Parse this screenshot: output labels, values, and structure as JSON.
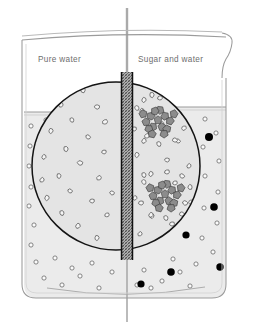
{
  "figure": {
    "type": "scientific-illustration",
    "width": 254,
    "height": 330,
    "background_color": "#ffffff"
  },
  "labels": {
    "left_label": "Pure water",
    "right_label": "Sugar and water"
  },
  "colors": {
    "outline": "#8f8f8f",
    "liquid_fill": "#ebebeb",
    "magnifier_fill": "#e2e2e2",
    "magnifier_stroke": "#1a1a1a",
    "membrane_fill": "#9a9a9a",
    "membrane_stroke": "#111111",
    "rod": "#a8a8a8",
    "sugar_solid": "#000000",
    "water_circle_stroke": "#6a6a6a",
    "crystal_fill": "#8c8c8c",
    "crystal_stroke": "#3a3a3a",
    "molecule_fill": "#f5f5f5",
    "molecule_stroke": "#555555",
    "label_text": "#6e6e6e"
  },
  "beaker": {
    "left_x": 22,
    "right_x": 228,
    "top_y": 31,
    "bottom_y": 311,
    "rim_y": 36,
    "base_ellipse_y": 296,
    "spout_side": "right",
    "corner_radius": 14
  },
  "liquid": {
    "left_surface_y": 112,
    "right_surface_y": 107,
    "fill_color": "#ebebeb",
    "note": "right compartment level is higher than left"
  },
  "membrane": {
    "label": "semipermeable-membrane",
    "x_center": 127,
    "width": 11,
    "top_y": 72,
    "bottom_y": 260,
    "pattern": "cross-hatch",
    "thin_line_top_y": 8,
    "thin_line_bottom_y": 320
  },
  "magnifier": {
    "label": "magnified-view-circle",
    "center_x": 116,
    "center_y": 166,
    "radius": 84
  },
  "magnified_left_molecules": [
    {
      "x": 83,
      "y": 90,
      "r": 3.0,
      "rot": 20
    },
    {
      "x": 61,
      "y": 105,
      "r": 2.6,
      "rot": 70
    },
    {
      "x": 97,
      "y": 107,
      "r": 2.8,
      "rot": 130
    },
    {
      "x": 72,
      "y": 120,
      "r": 2.5,
      "rot": 10
    },
    {
      "x": 105,
      "y": 122,
      "r": 2.9,
      "rot": 95
    },
    {
      "x": 51,
      "y": 131,
      "r": 2.7,
      "rot": 45
    },
    {
      "x": 88,
      "y": 137,
      "r": 2.6,
      "rot": 160
    },
    {
      "x": 66,
      "y": 149,
      "r": 2.8,
      "rot": 25
    },
    {
      "x": 104,
      "y": 152,
      "r": 2.5,
      "rot": 115
    },
    {
      "x": 44,
      "y": 157,
      "r": 2.6,
      "rot": 60
    },
    {
      "x": 80,
      "y": 163,
      "r": 2.9,
      "rot": 140
    },
    {
      "x": 59,
      "y": 176,
      "r": 2.6,
      "rot": 30
    },
    {
      "x": 99,
      "y": 178,
      "r": 2.7,
      "rot": 85
    },
    {
      "x": 70,
      "y": 191,
      "r": 2.5,
      "rot": 155
    },
    {
      "x": 47,
      "y": 198,
      "r": 2.8,
      "rot": 50
    },
    {
      "x": 92,
      "y": 201,
      "r": 2.6,
      "rot": 120
    },
    {
      "x": 62,
      "y": 213,
      "r": 2.7,
      "rot": 15
    },
    {
      "x": 107,
      "y": 215,
      "r": 2.5,
      "rot": 100
    },
    {
      "x": 78,
      "y": 226,
      "r": 2.8,
      "rot": 65
    },
    {
      "x": 53,
      "y": 233,
      "r": 2.6,
      "rot": 135
    },
    {
      "x": 97,
      "y": 238,
      "r": 2.7,
      "rot": 40
    },
    {
      "x": 69,
      "y": 247,
      "r": 2.5,
      "rot": 110
    },
    {
      "x": 42,
      "y": 180,
      "r": 2.6,
      "rot": 75
    },
    {
      "x": 112,
      "y": 193,
      "r": 2.5,
      "rot": 145
    }
  ],
  "magnified_right_molecules": [
    {
      "x": 152,
      "y": 95,
      "r": 2.8,
      "rot": 30
    },
    {
      "x": 176,
      "y": 99,
      "r": 2.6,
      "rot": 100
    },
    {
      "x": 142,
      "y": 111,
      "r": 2.7,
      "rot": 55
    },
    {
      "x": 186,
      "y": 116,
      "r": 2.5,
      "rot": 140
    },
    {
      "x": 162,
      "y": 124,
      "r": 2.6,
      "rot": 20
    },
    {
      "x": 147,
      "y": 136,
      "r": 2.8,
      "rot": 90
    },
    {
      "x": 178,
      "y": 141,
      "r": 2.5,
      "rot": 165
    },
    {
      "x": 137,
      "y": 155,
      "r": 2.7,
      "rot": 45
    },
    {
      "x": 167,
      "y": 160,
      "r": 2.6,
      "rot": 125
    },
    {
      "x": 189,
      "y": 166,
      "r": 2.5,
      "rot": 70
    },
    {
      "x": 144,
      "y": 175,
      "r": 2.7,
      "rot": 15
    },
    {
      "x": 175,
      "y": 183,
      "r": 2.6,
      "rot": 105
    },
    {
      "x": 135,
      "y": 198,
      "r": 2.5,
      "rot": 60
    },
    {
      "x": 185,
      "y": 203,
      "r": 2.8,
      "rot": 150
    },
    {
      "x": 152,
      "y": 216,
      "r": 2.6,
      "rot": 35
    },
    {
      "x": 172,
      "y": 224,
      "r": 2.7,
      "rot": 115
    },
    {
      "x": 140,
      "y": 234,
      "r": 2.5,
      "rot": 80
    },
    {
      "x": 163,
      "y": 241,
      "r": 2.6,
      "rot": 25
    }
  ],
  "sugar_clusters": [
    {
      "id": "cluster-upper",
      "center_x": 158,
      "center_y": 120,
      "crystal_count": 15,
      "halo_molecule_count": 10
    },
    {
      "id": "cluster-lower",
      "center_x": 165,
      "center_y": 194,
      "crystal_count": 15,
      "halo_molecule_count": 10
    }
  ],
  "outer_water_circles_left": [
    {
      "x": 31,
      "y": 126
    },
    {
      "x": 30,
      "y": 146
    },
    {
      "x": 29,
      "y": 166
    },
    {
      "x": 31,
      "y": 187
    },
    {
      "x": 29,
      "y": 206
    },
    {
      "x": 34,
      "y": 225
    },
    {
      "x": 31,
      "y": 245
    },
    {
      "x": 36,
      "y": 262
    },
    {
      "x": 44,
      "y": 278
    },
    {
      "x": 62,
      "y": 285
    },
    {
      "x": 80,
      "y": 276
    },
    {
      "x": 99,
      "y": 288
    },
    {
      "x": 55,
      "y": 258
    },
    {
      "x": 46,
      "y": 120
    },
    {
      "x": 112,
      "y": 272
    },
    {
      "x": 92,
      "y": 263
    },
    {
      "x": 72,
      "y": 268
    }
  ],
  "outer_water_circles_right": [
    {
      "x": 205,
      "y": 119
    },
    {
      "x": 216,
      "y": 133
    },
    {
      "x": 203,
      "y": 147
    },
    {
      "x": 219,
      "y": 161
    },
    {
      "x": 205,
      "y": 176
    },
    {
      "x": 218,
      "y": 192
    },
    {
      "x": 204,
      "y": 208
    },
    {
      "x": 217,
      "y": 223
    },
    {
      "x": 202,
      "y": 238
    },
    {
      "x": 213,
      "y": 252
    },
    {
      "x": 196,
      "y": 264
    },
    {
      "x": 180,
      "y": 272
    },
    {
      "x": 162,
      "y": 281
    },
    {
      "x": 144,
      "y": 270
    },
    {
      "x": 151,
      "y": 288
    },
    {
      "x": 190,
      "y": 286
    },
    {
      "x": 173,
      "y": 259
    },
    {
      "x": 137,
      "y": 285
    }
  ],
  "outer_sugar_dots_right": [
    {
      "x": 209,
      "y": 137,
      "r": 4.0
    },
    {
      "x": 214,
      "y": 207,
      "r": 3.8
    },
    {
      "x": 186,
      "y": 235,
      "r": 3.6
    },
    {
      "x": 171,
      "y": 272,
      "r": 3.8
    },
    {
      "x": 141,
      "y": 284,
      "r": 3.6
    },
    {
      "x": 220,
      "y": 267,
      "r": 3.7
    }
  ]
}
